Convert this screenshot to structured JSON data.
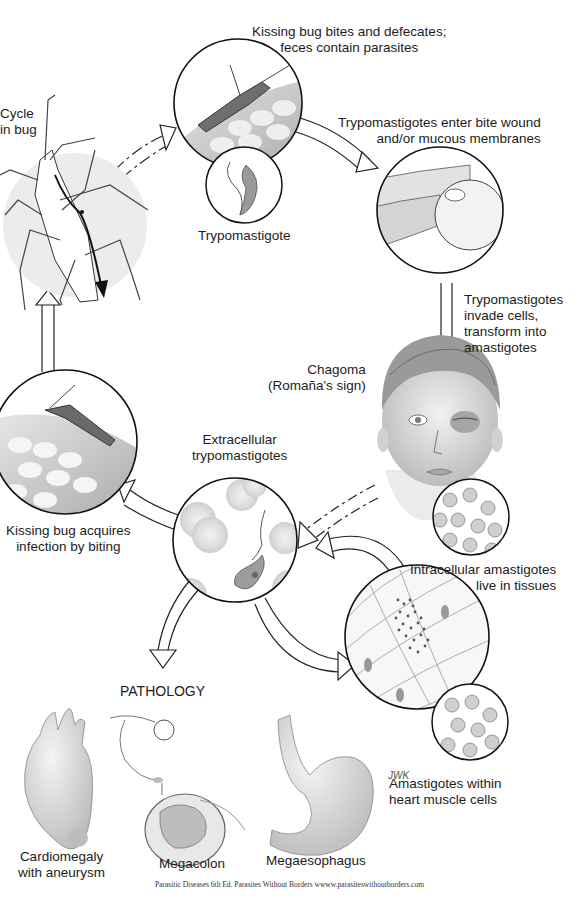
{
  "diagram": {
    "title_partial": "Cycle in bug",
    "stages": [
      {
        "id": "bug-cycle",
        "label": "Cycle\nin bug"
      },
      {
        "id": "bite",
        "label": "Kissing bug bites and defecates;\nfeces contain parasites"
      },
      {
        "id": "trypomastigote",
        "label": "Trypomastigote"
      },
      {
        "id": "entry",
        "label": "Trypomastigotes enter bite wound\nand/or mucous membranes"
      },
      {
        "id": "invade",
        "label": "Trypomastigotes\ninvade cells,\ntransform into\namastigotes"
      },
      {
        "id": "chagoma",
        "label": "Chagoma\n(Romaña's sign)"
      },
      {
        "id": "extracellular",
        "label": "Extracellular\ntrypomastigotes"
      },
      {
        "id": "acquire",
        "label": "Kissing bug acquires\ninfection by biting"
      },
      {
        "id": "intracellular",
        "label": "Intracellular amastigotes\nlive in tissues"
      },
      {
        "id": "heart-cells",
        "label": "Amastigotes within\nheart muscle cells"
      }
    ],
    "pathology": {
      "heading": "PATHOLOGY",
      "items": [
        {
          "id": "cardiomegaly",
          "label": "Cardiomegaly\nwith aneurysm"
        },
        {
          "id": "megacolon",
          "label": "Megacolon"
        },
        {
          "id": "megaesophagus",
          "label": "Megaesophagus"
        }
      ]
    },
    "artist_signature": "JWK",
    "credit": "Parasitic Diseases 6th Ed. Parasites Without Borders wwww.parasiteswithoutborders.com"
  },
  "labels": {
    "cycle_l1": "Cycle",
    "cycle_l2": "in bug",
    "bite_l1": "Kissing bug bites and defecates;",
    "bite_l2": "feces contain parasites",
    "trypo": "Trypomastigote",
    "entry_l1": "Trypomastigotes enter bite wound",
    "entry_l2": "and/or mucous membranes",
    "invade_l1": "Trypomastigotes",
    "invade_l2": "invade cells,",
    "invade_l3": "transform into",
    "invade_l4": "amastigotes",
    "chagoma_l1": "Chagoma",
    "chagoma_l2": "(Romaña's sign)",
    "extra_l1": "Extracellular",
    "extra_l2": "trypomastigotes",
    "acquire_l1": "Kissing bug acquires",
    "acquire_l2": "infection by biting",
    "intra_l1": "Intracellular amastigotes",
    "intra_l2": "live in tissues",
    "pathology": "PATHOLOGY",
    "heart_l1": "Amastigotes within",
    "heart_l2": "heart muscle cells",
    "cardio_l1": "Cardiomegaly",
    "cardio_l2": "with aneurysm",
    "megacolon": "Megacolon",
    "megaeso": "Megaesophagus",
    "signature": "JWK",
    "credit": "Parasitic Diseases 6th Ed. Parasites Without Borders wwww.parasiteswithoutborders.com"
  },
  "colors": {
    "line": "#111111",
    "shade": "#d9d9d9",
    "light_shade": "#eeeeee",
    "cell": "#c8c8c8",
    "background": "#ffffff"
  }
}
